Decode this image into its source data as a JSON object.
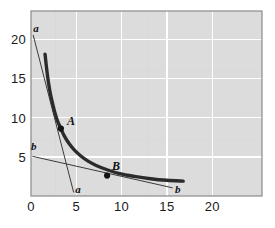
{
  "chart_data": {
    "type": "line",
    "title": "",
    "subtitle": "",
    "xlabel": "",
    "ylabel": "",
    "xlim": [
      0,
      25.5
    ],
    "ylim": [
      0,
      23.6
    ],
    "grid": true,
    "grid_color": "#ffffff",
    "plot_background": "#dcdcdc",
    "legend": "none",
    "x_ticks": [
      {
        "value": 0,
        "label": "0"
      },
      {
        "value": 5,
        "label": "5"
      },
      {
        "value": 10,
        "label": "10"
      },
      {
        "value": 15,
        "label": "15"
      },
      {
        "value": 20,
        "label": "20"
      }
    ],
    "y_ticks": [
      {
        "value": 5,
        "label": "5"
      },
      {
        "value": 10,
        "label": "10"
      },
      {
        "value": 15,
        "label": "15"
      },
      {
        "value": 20,
        "label": "20"
      }
    ],
    "series": [
      {
        "name": "indifference-curve",
        "type": "curve",
        "style": "thick-solid",
        "color": "#2b2b2b",
        "width": 3.4,
        "equation": "x*y = 28",
        "points": [
          [
            1.55,
            18.1
          ],
          [
            1.7,
            16.5
          ],
          [
            1.9,
            14.7
          ],
          [
            2.1,
            13.3
          ],
          [
            2.3,
            12.2
          ],
          [
            2.6,
            10.8
          ],
          [
            2.9,
            9.65
          ],
          [
            3.3,
            8.6
          ],
          [
            3.7,
            7.6
          ],
          [
            4.2,
            6.7
          ],
          [
            4.8,
            5.85
          ],
          [
            5.5,
            5.1
          ],
          [
            6.3,
            4.45
          ],
          [
            7.2,
            3.9
          ],
          [
            8.4,
            3.35
          ],
          [
            9.8,
            2.85
          ],
          [
            11.4,
            2.5
          ],
          [
            13.2,
            2.2
          ],
          [
            15.0,
            2.0
          ],
          [
            16.8,
            1.9
          ]
        ]
      },
      {
        "name": "budget-line-a",
        "type": "line",
        "style": "thin-solid",
        "color": "#3a3a3a",
        "width": 1,
        "from": [
          0.25,
          20.5
        ],
        "to": [
          4.7,
          0.5
        ],
        "labels": [
          "a",
          "a"
        ]
      },
      {
        "name": "budget-line-b",
        "type": "line",
        "style": "thin-solid",
        "color": "#3a3a3a",
        "width": 1,
        "from": [
          0.2,
          5.05
        ],
        "to": [
          15.6,
          1.05
        ],
        "labels": [
          "b",
          "b"
        ]
      }
    ],
    "markers": [
      {
        "name": "A",
        "label": "A",
        "x": 3.3,
        "y": 8.6,
        "label_dx": 10,
        "label_dy": -8
      },
      {
        "name": "B",
        "label": "B",
        "x": 8.4,
        "y": 2.6,
        "label_dx": 9,
        "label_dy": -10
      }
    ],
    "line_end_labels": [
      {
        "name": "a-top",
        "text": "a",
        "x": 0.55,
        "y": 21.4
      },
      {
        "name": "a-bottom",
        "text": "a",
        "x": 5.2,
        "y": 0.85
      },
      {
        "name": "b-left",
        "text": "b",
        "x": 0.3,
        "y": 6.4
      },
      {
        "name": "b-right",
        "text": "b",
        "x": 16.2,
        "y": 0.85
      }
    ],
    "annotations": []
  },
  "figure": {
    "background": "#ffffff",
    "border_color": "#8a8a8a"
  }
}
